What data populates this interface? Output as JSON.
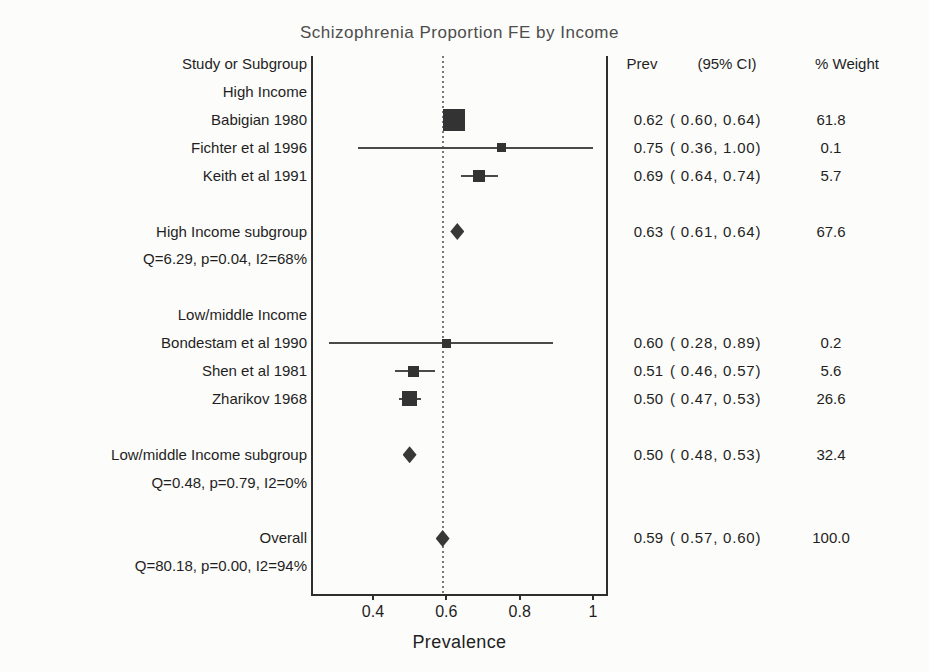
{
  "title": "Schizophrenia Proportion FE by Income",
  "columns": {
    "study": "Study or Subgroup",
    "prev": "Prev",
    "ci": "(95% CI)",
    "weight": "% Weight"
  },
  "chart_data": {
    "type": "forest",
    "title": "Schizophrenia Proportion FE by Income",
    "xlabel": "Prevalence",
    "xlim": [
      0.234,
      1.038
    ],
    "x_ticks": [
      {
        "value": 0.4,
        "label": "0.4"
      },
      {
        "value": 0.6,
        "label": "0.6"
      },
      {
        "value": 0.8,
        "label": "0.8"
      },
      {
        "value": 1.0,
        "label": "1"
      }
    ],
    "reference_line": 0.59,
    "grid": false,
    "colors": {
      "marker": "#333333",
      "ci_line": "#4a4a4a",
      "axis": "#2e2e2e",
      "reference": "#787878",
      "title": "#4d4d4d",
      "text": "#1f1f1f"
    },
    "rows": [
      {
        "kind": "group",
        "label": "High Income"
      },
      {
        "kind": "study",
        "label": "Babigian 1980",
        "prev": 0.62,
        "ci": [
          0.6,
          0.64
        ],
        "weight": 61.8,
        "prev_text": "0.62",
        "ci_text": "( 0.60, 0.64)",
        "weight_text": "61.8",
        "marker_px": 22
      },
      {
        "kind": "study",
        "label": "Fichter et al 1996",
        "prev": 0.75,
        "ci": [
          0.36,
          1.0
        ],
        "weight": 0.1,
        "prev_text": "0.75",
        "ci_text": "( 0.36, 1.00)",
        "weight_text": "0.1",
        "marker_px": 9
      },
      {
        "kind": "study",
        "label": "Keith et al 1991",
        "prev": 0.69,
        "ci": [
          0.64,
          0.74
        ],
        "weight": 5.7,
        "prev_text": "0.69",
        "ci_text": "( 0.64, 0.74)",
        "weight_text": "5.7",
        "marker_px": 12
      },
      {
        "kind": "spacer"
      },
      {
        "kind": "summary",
        "label": "High Income subgroup",
        "prev": 0.63,
        "ci": [
          0.61,
          0.64
        ],
        "weight": 67.6,
        "prev_text": "0.63",
        "ci_text": "( 0.61, 0.64)",
        "weight_text": "67.6"
      },
      {
        "kind": "stats",
        "label": "Q=6.29, p=0.04, I2=68%"
      },
      {
        "kind": "spacer"
      },
      {
        "kind": "group",
        "label": "Low/middle Income"
      },
      {
        "kind": "study",
        "label": "Bondestam et al 1990",
        "prev": 0.6,
        "ci": [
          0.28,
          0.89
        ],
        "weight": 0.2,
        "prev_text": "0.60",
        "ci_text": "( 0.28, 0.89)",
        "weight_text": "0.2",
        "marker_px": 9
      },
      {
        "kind": "study",
        "label": "Shen et al 1981",
        "prev": 0.51,
        "ci": [
          0.46,
          0.57
        ],
        "weight": 5.6,
        "prev_text": "0.51",
        "ci_text": "( 0.46, 0.57)",
        "weight_text": "5.6",
        "marker_px": 11
      },
      {
        "kind": "study",
        "label": "Zharikov 1968",
        "prev": 0.5,
        "ci": [
          0.47,
          0.53
        ],
        "weight": 26.6,
        "prev_text": "0.50",
        "ci_text": "( 0.47, 0.53)",
        "weight_text": "26.6",
        "marker_px": 15
      },
      {
        "kind": "spacer"
      },
      {
        "kind": "summary",
        "label": "Low/middle Income subgroup",
        "prev": 0.5,
        "ci": [
          0.48,
          0.53
        ],
        "weight": 32.4,
        "prev_text": "0.50",
        "ci_text": "( 0.48, 0.53)",
        "weight_text": "32.4"
      },
      {
        "kind": "stats",
        "label": "Q=0.48, p=0.79, I2=0%"
      },
      {
        "kind": "spacer"
      },
      {
        "kind": "summary",
        "label": "Overall",
        "prev": 0.59,
        "ci": [
          0.57,
          0.6
        ],
        "weight": 100.0,
        "prev_text": "0.59",
        "ci_text": "( 0.57, 0.60)",
        "weight_text": "100.0"
      },
      {
        "kind": "stats",
        "label": "Q=80.18, p=0.00, I2=94%"
      }
    ]
  }
}
